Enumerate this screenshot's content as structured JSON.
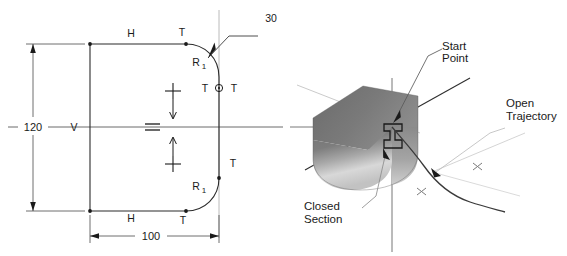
{
  "figure": {
    "title": "",
    "background_color": "#ffffff",
    "line_color": "#2b2b2b",
    "construction_color": "#9a9a9a",
    "solid_dark": "#6e6e6e",
    "solid_light": "#d2d2d2"
  },
  "left_diagram": {
    "name": "constrained-section-sketch",
    "labels": {
      "h_top": "H",
      "h_bottom": "H",
      "v_left": "V",
      "t_top": "T",
      "t_top_right": "T",
      "t_mid_left": "T",
      "t_mid_right": "T",
      "t_lower_right": "T",
      "t_bottom": "T",
      "r_upper": "R",
      "r_upper_sub": "1",
      "r_lower": "R",
      "r_lower_sub": "1",
      "equal_symbol": "=",
      "radius_callout": "30"
    },
    "dimensions": [
      {
        "name": "vertical-dimension",
        "value": "120",
        "orientation": "vertical"
      },
      {
        "name": "horizontal-dimension",
        "value": "100",
        "orientation": "horizontal"
      }
    ]
  },
  "right_diagram": {
    "name": "sweep-preview-3d",
    "labels": {
      "start_point_line1": "Start",
      "start_point_line2": "Point",
      "open_trajectory_line1": "Open",
      "open_trajectory_line2": "Trajectory",
      "closed_section_line1": "Closed",
      "closed_section_line2": "Section"
    },
    "markers": {
      "cross_1": "x",
      "cross_2": "x"
    }
  }
}
